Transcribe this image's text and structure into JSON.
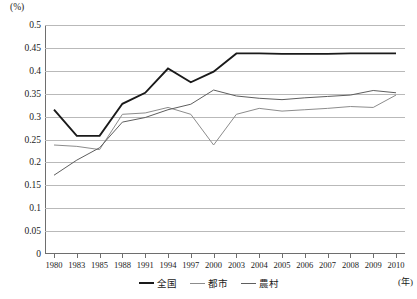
{
  "axis": {
    "unit_label": "(%)",
    "year_unit_label": "(年)",
    "y_ticks": [
      "0.5",
      "0.45",
      "0.4",
      "0.35",
      "0.3",
      "0.25",
      "0.2",
      "0.15",
      "0.1",
      "0.05",
      "0"
    ]
  },
  "legend": {
    "items": [
      {
        "label": "全国",
        "color": "#1a1a1a"
      },
      {
        "label": "都市",
        "color": "#8c8c8c"
      },
      {
        "label": "農村",
        "color": "#5e5e5e"
      }
    ]
  },
  "chart_data": {
    "type": "line",
    "title": "",
    "subtitle": "",
    "xlabel": "(年)",
    "ylabel": "(%)",
    "ylim": [
      0,
      0.5
    ],
    "ytick_step": 0.05,
    "grid": true,
    "legend_position": "bottom",
    "categories": [
      "1980",
      "1983",
      "1985",
      "1988",
      "1991",
      "1994",
      "1997",
      "2000",
      "2003",
      "2004",
      "2005",
      "2006",
      "2007",
      "2008",
      "2009",
      "2010"
    ],
    "series": [
      {
        "name": "全国",
        "color": "#1a1a1a",
        "values": [
          0.315,
          0.258,
          0.258,
          0.328,
          0.352,
          0.405,
          0.375,
          0.398,
          0.438,
          0.438,
          0.437,
          0.437,
          0.437,
          0.438,
          0.438,
          0.438
        ]
      },
      {
        "name": "都市",
        "color": "#8c8c8c",
        "values": [
          0.238,
          0.235,
          0.228,
          0.305,
          0.308,
          0.32,
          0.305,
          0.238,
          0.305,
          0.318,
          0.312,
          0.315,
          0.318,
          0.322,
          0.32,
          0.347
        ]
      },
      {
        "name": "農村",
        "color": "#5e5e5e",
        "values": [
          0.172,
          0.205,
          0.232,
          0.288,
          0.298,
          0.315,
          0.327,
          0.358,
          0.345,
          0.34,
          0.337,
          0.341,
          0.344,
          0.347,
          0.357,
          0.352
        ]
      }
    ]
  }
}
